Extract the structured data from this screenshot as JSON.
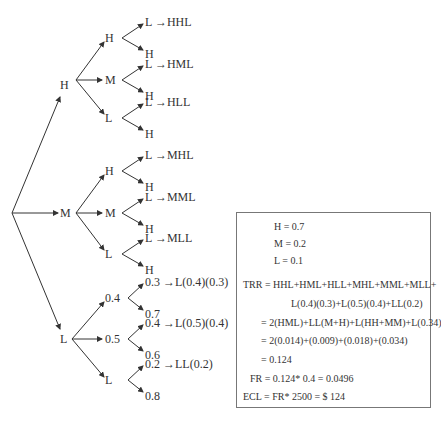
{
  "tree": {
    "root": "",
    "level1": [
      "H",
      "M",
      "L"
    ],
    "level2": {
      "H": [
        "H",
        "M",
        "L"
      ],
      "M": [
        "H",
        "M",
        "L"
      ],
      "L": [
        "0.4",
        "0.5",
        "L"
      ]
    },
    "leaves": [
      {
        "top": "L →HHL",
        "bottom": "H"
      },
      {
        "top": "L →HML",
        "bottom": "H"
      },
      {
        "top": "L →HLL",
        "bottom": "H"
      },
      {
        "top": "L →MHL",
        "bottom": "H"
      },
      {
        "top": "L →MML",
        "bottom": "H"
      },
      {
        "top": "L →MLL",
        "bottom": "H"
      },
      {
        "top": "0.3 →L(0.4)(0.3)",
        "bottom": "0.7"
      },
      {
        "top": "0.4 →L(0.5)(0.4)",
        "bottom": "0.6"
      },
      {
        "top": "0.2 →LL(0.2)",
        "bottom": "0.8"
      }
    ]
  },
  "box": {
    "probs": [
      "H = 0.7",
      "M = 0.2",
      "L = 0.1"
    ],
    "trr": [
      "TRR = HHL+HML+HLL+MHL+MML+MLL+",
      "L(0.4)(0.3)+L(0.5)(0.4)+LL(0.2)",
      "= 2(HML)+LL(M+H)+L(HH+MM)+L(0.34)",
      "= 2(0.014)+(0.009)+(0.018)+(0.034)",
      "= 0.124"
    ],
    "fr": "FR = 0.124* 0.4 = 0.0496",
    "ecl": "ECL = FR* 2500 = $ 124"
  }
}
